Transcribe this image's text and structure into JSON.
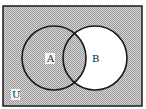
{
  "diagram": {
    "type": "venn",
    "universe_label": "U",
    "sets": [
      {
        "label": "A",
        "shaded": true
      },
      {
        "label": "B",
        "shaded": false
      }
    ],
    "shaded_region": "A ∪ (U − B)",
    "unshaded_region": "B − A",
    "colors": {
      "shade": "#b8b8b8",
      "unshaded": "#ffffff",
      "stroke": "#1a1a1a"
    }
  }
}
